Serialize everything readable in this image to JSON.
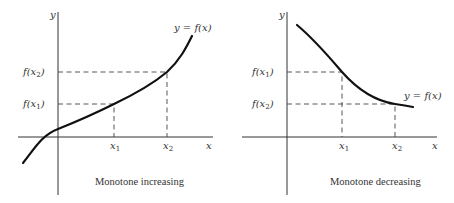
{
  "panels": [
    {
      "id": "increasing",
      "caption": "Monotone increasing",
      "axis_labels": {
        "x": "x",
        "y": "y"
      },
      "curve_label": "y = f(x)",
      "x_ticks": [
        {
          "label": "x",
          "sub": "1"
        },
        {
          "label": "x",
          "sub": "2"
        }
      ],
      "y_ticks": [
        {
          "label": "f(x",
          "sub": "2",
          "close": ")"
        },
        {
          "label": "f(x",
          "sub": "1",
          "close": ")"
        }
      ]
    },
    {
      "id": "decreasing",
      "caption": "Monotone decreasing",
      "axis_labels": {
        "x": "x",
        "y": "y"
      },
      "curve_label": "y = f(x)",
      "x_ticks": [
        {
          "label": "x",
          "sub": "1"
        },
        {
          "label": "x",
          "sub": "2"
        }
      ],
      "y_ticks": [
        {
          "label": "f(x",
          "sub": "1",
          "close": ")"
        },
        {
          "label": "f(x",
          "sub": "2",
          "close": ")"
        }
      ]
    }
  ],
  "colors": {
    "ink": "#111111",
    "background": "#ffffff"
  }
}
